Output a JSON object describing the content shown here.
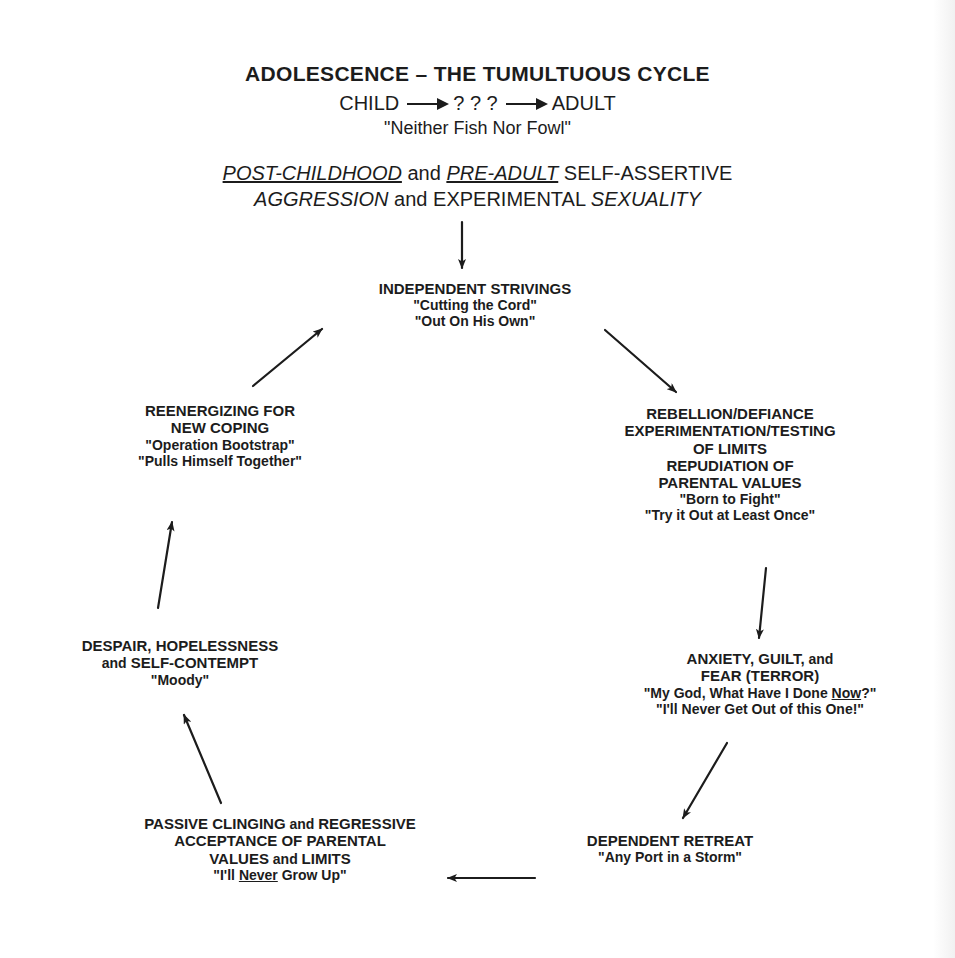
{
  "header": {
    "title": "ADOLESCENCE – THE TUMULTUOUS CYCLE",
    "progression": {
      "start": "CHILD",
      "middle": "? ? ?",
      "end": "ADULT"
    },
    "tagline": "\"Neither Fish Nor Fowl\"",
    "subtitle_line1": {
      "part1": "POST-CHILDHOOD",
      "part2": " and ",
      "part3": "PRE-ADULT",
      "part4": " SELF-ASSERTIVE"
    },
    "subtitle_line2": {
      "part1": "AGGRESSION",
      "part2": " and EXPERIMENTAL ",
      "part3": "SEXUALITY"
    }
  },
  "cycle": {
    "independent": {
      "heading": "INDEPENDENT STRIVINGS",
      "quotes": [
        "\"Cutting the Cord\"",
        "\"Out On His Own\""
      ]
    },
    "rebellion": {
      "heading_lines": [
        "REBELLION/DEFIANCE",
        "EXPERIMENTATION/TESTING",
        "OF LIMITS",
        "REPUDIATION OF",
        "PARENTAL VALUES"
      ],
      "quotes": [
        "\"Born to Fight\"",
        "\"Try it Out at Least Once\""
      ]
    },
    "anxiety": {
      "heading_line1_a": "ANXIETY, GUILT,",
      "heading_line1_b": " and",
      "heading_line2": "FEAR (TERROR)",
      "quote1_a": "\"My God, What Have I Done ",
      "quote1_b": "Now",
      "quote1_c": "?\"",
      "quote2": "\"I'll Never Get Out of this One!\""
    },
    "dependent": {
      "heading": "DEPENDENT RETREAT",
      "quote": "\"Any Port in a Storm\""
    },
    "passive": {
      "line1_a": "PASSIVE CLINGING",
      "line1_b": " and ",
      "line1_c": "REGRESSIVE",
      "line2": "ACCEPTANCE OF PARENTAL",
      "line3_a": "VALUES",
      "line3_b": " and ",
      "line3_c": "LIMITS",
      "quote_a": "\"I'll ",
      "quote_b": "Never",
      "quote_c": " Grow Up\""
    },
    "despair": {
      "line1": "DESPAIR, HOPELESSNESS",
      "line2_a": "and",
      "line2_b": " SELF-CONTEMPT",
      "quote": "\"Moody\""
    },
    "reenergize": {
      "heading_lines": [
        "REENERGIZING FOR",
        "NEW COPING"
      ],
      "quotes": [
        "\"Operation Bootstrap\"",
        "\"Pulls Himself Together\""
      ]
    }
  },
  "arrows": [
    {
      "name": "header-to-independent",
      "x1": 462,
      "y1": 222,
      "x2": 462,
      "y2": 268
    },
    {
      "name": "independent-to-rebellion",
      "x1": 605,
      "y1": 330,
      "x2": 676,
      "y2": 392
    },
    {
      "name": "rebellion-to-anxiety",
      "x1": 766,
      "y1": 568,
      "x2": 759,
      "y2": 638
    },
    {
      "name": "anxiety-to-dependent",
      "x1": 727,
      "y1": 743,
      "x2": 683,
      "y2": 818
    },
    {
      "name": "dependent-to-passive",
      "x1": 535,
      "y1": 878,
      "x2": 448,
      "y2": 878
    },
    {
      "name": "passive-to-despair",
      "x1": 221,
      "y1": 803,
      "x2": 184,
      "y2": 715
    },
    {
      "name": "despair-to-reenergize",
      "x1": 158,
      "y1": 608,
      "x2": 172,
      "y2": 522
    },
    {
      "name": "reenergize-to-independent",
      "x1": 253,
      "y1": 386,
      "x2": 322,
      "y2": 329
    }
  ],
  "colors": {
    "ink": "#1c1c1c",
    "paper": "#ffffff"
  }
}
